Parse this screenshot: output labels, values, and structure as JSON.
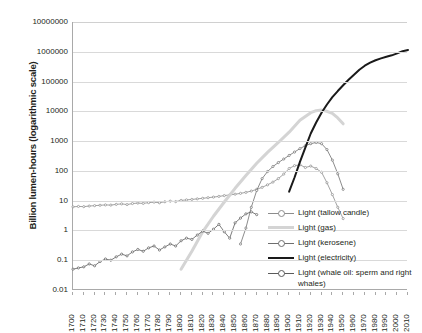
{
  "chart_data": {
    "type": "line",
    "title": "",
    "xlabel": "",
    "ylabel": "Billion lumen-hours (logarithmic scale)",
    "y_scale": "log",
    "ylim": [
      0.01,
      10000000
    ],
    "xlim": [
      1700,
      2010
    ],
    "grid": true,
    "legend_position": "inside-bottom-right",
    "y_ticks": [
      "10000000",
      "1000000",
      "100000",
      "10000",
      "1000",
      "100",
      "10",
      "1",
      "0.1",
      "0.01"
    ],
    "x_ticks": [
      "1700",
      "1710",
      "1720",
      "1730",
      "1740",
      "1750",
      "1760",
      "1770",
      "1780",
      "1790",
      "1800",
      "1810",
      "1820",
      "1830",
      "1840",
      "1850",
      "1860",
      "1870",
      "1880",
      "1890",
      "1900",
      "1910",
      "1920",
      "1930",
      "1940",
      "1950",
      "1960",
      "1970",
      "1980",
      "1990",
      "2000",
      "2010"
    ],
    "series": [
      {
        "name": "Light (tallow candle)",
        "color": "#8c8c8c",
        "style": "thin-line-markers",
        "x": [
          1700,
          1705,
          1710,
          1715,
          1720,
          1725,
          1730,
          1735,
          1740,
          1745,
          1750,
          1755,
          1760,
          1765,
          1770,
          1775,
          1780,
          1785,
          1790,
          1795,
          1800,
          1805,
          1810,
          1815,
          1820,
          1825,
          1830,
          1835,
          1840,
          1845,
          1850,
          1855,
          1860,
          1865,
          1870,
          1875,
          1880,
          1885,
          1890,
          1895,
          1900,
          1905,
          1910,
          1915,
          1920,
          1925,
          1930,
          1935,
          1940,
          1945,
          1950
        ],
        "y": [
          6.2,
          6.4,
          6.3,
          6.6,
          6.8,
          7.0,
          7.2,
          7.1,
          7.5,
          7.8,
          7.4,
          8.0,
          8.3,
          8.1,
          8.6,
          8.9,
          8.5,
          9.2,
          9.6,
          9.3,
          10.2,
          10.6,
          11.0,
          11.5,
          12.0,
          12.6,
          13.2,
          13.9,
          14.8,
          15.6,
          16.5,
          17.6,
          19.0,
          21.0,
          24.0,
          28.0,
          34.0,
          42.0,
          55.0,
          78.0,
          120.0,
          150.0,
          160.0,
          130.0,
          145.0,
          120.0,
          90.0,
          40.0,
          16.0,
          6.0,
          2.5
        ]
      },
      {
        "name": "Light (gas)",
        "color": "#d4d4d4",
        "style": "thick-line",
        "x": [
          1800,
          1810,
          1820,
          1830,
          1840,
          1850,
          1860,
          1870,
          1880,
          1890,
          1900,
          1910,
          1920,
          1925,
          1930,
          1935,
          1940,
          1945,
          1950
        ],
        "y": [
          0.05,
          0.2,
          0.9,
          3.0,
          9.0,
          26.0,
          70.0,
          180.0,
          420.0,
          900.0,
          2000.0,
          5000.0,
          9000.0,
          10500.0,
          11000.0,
          10000.0,
          8500.0,
          6000.0,
          3800.0
        ]
      },
      {
        "name": "Light (kerosene)",
        "color": "#6e6e6e",
        "style": "thin-line-markers",
        "x": [
          1855,
          1860,
          1865,
          1870,
          1875,
          1880,
          1885,
          1890,
          1895,
          1900,
          1905,
          1910,
          1915,
          1920,
          1925,
          1930,
          1935,
          1940,
          1945,
          1950
        ],
        "y": [
          0.35,
          1.2,
          6.0,
          22.0,
          55.0,
          95.0,
          140.0,
          190.0,
          250.0,
          330.0,
          430.0,
          560.0,
          700.0,
          820.0,
          900.0,
          820.0,
          520.0,
          230.0,
          80.0,
          24.0
        ]
      },
      {
        "name": "Light (electricity)",
        "color": "#1a1a1a",
        "style": "thick-solid",
        "x": [
          1900,
          1905,
          1910,
          1915,
          1920,
          1925,
          1930,
          1935,
          1940,
          1945,
          1950,
          1955,
          1960,
          1965,
          1970,
          1975,
          1980,
          1985,
          1990,
          1995,
          2000,
          2005,
          2010
        ],
        "y": [
          20.0,
          60.0,
          200.0,
          600.0,
          1800.0,
          4200.0,
          9000.0,
          17000.0,
          30000.0,
          48000.0,
          75000.0,
          115000.0,
          170000.0,
          250000.0,
          340000.0,
          430000.0,
          520000.0,
          600000.0,
          680000.0,
          760000.0,
          880000.0,
          1050000.0,
          1150000.0
        ]
      },
      {
        "name": "Light (whale oil: sperm and right whales)",
        "color": "#5a5a5a",
        "style": "thin-line-markers",
        "x": [
          1700,
          1705,
          1710,
          1715,
          1720,
          1725,
          1730,
          1735,
          1740,
          1745,
          1750,
          1755,
          1760,
          1765,
          1770,
          1775,
          1780,
          1785,
          1790,
          1795,
          1800,
          1805,
          1810,
          1815,
          1820,
          1825,
          1830,
          1835,
          1840,
          1845,
          1850,
          1855,
          1860,
          1865,
          1870
        ],
        "y": [
          0.05,
          0.055,
          0.06,
          0.075,
          0.065,
          0.09,
          0.11,
          0.1,
          0.13,
          0.16,
          0.14,
          0.19,
          0.23,
          0.2,
          0.26,
          0.3,
          0.22,
          0.28,
          0.35,
          0.3,
          0.45,
          0.55,
          0.5,
          0.7,
          0.95,
          0.8,
          1.1,
          1.6,
          0.9,
          0.55,
          1.8,
          2.6,
          3.6,
          4.2,
          3.4
        ]
      }
    ]
  },
  "legend": {
    "items": [
      {
        "label": "Light (tallow candle)"
      },
      {
        "label": "Light (gas)"
      },
      {
        "label": "Light (kerosene)"
      },
      {
        "label": "Light (electricity)"
      },
      {
        "label": "Light (whale oil: sperm and right whales)"
      }
    ]
  }
}
